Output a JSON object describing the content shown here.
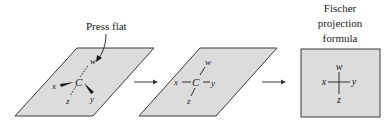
{
  "figure": {
    "caption_press": "Press flat",
    "caption_fischer": [
      "Fischer",
      "projection",
      "formula"
    ],
    "colors": {
      "plane_fill": "#dcdcdc",
      "plane_stroke": "#3a3a3a",
      "ink": "#1a1a1a"
    },
    "stage1": {
      "center": "C",
      "top": "w",
      "left": "x",
      "right": "y",
      "bottom": "z",
      "note": "wedge bonds to x and y, dashed bonds to w and z"
    },
    "stage2": {
      "center": "C",
      "top": "w",
      "left": "x",
      "right": "y",
      "bottom": "z"
    },
    "stage3": {
      "top": "w",
      "left": "x",
      "right": "y",
      "bottom": "z"
    }
  }
}
